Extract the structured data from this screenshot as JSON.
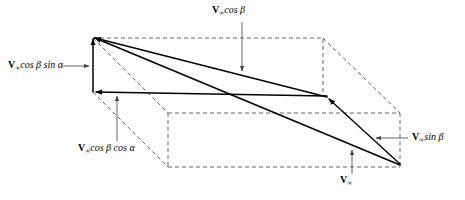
{
  "figure": {
    "type": "vector-decomposition-diagram",
    "colors": {
      "vector": "#000000",
      "box_dashed": "#555555",
      "leader": "#555555",
      "background": "#ffffff"
    }
  },
  "labels": {
    "v_cos_beta": {
      "symbol": "V",
      "subscript": "∞",
      "expr": "cos β",
      "full": "V∞ cos β"
    },
    "v_cos_beta_sin_alpha": {
      "symbol": "V",
      "subscript": "∞",
      "expr": "cos β sin α",
      "full": "V∞ cos β sin α"
    },
    "v_cos_beta_cos_alpha": {
      "symbol": "V",
      "subscript": "∞",
      "expr": "cos β cos α",
      "full": "V∞ cos β cos α"
    },
    "v_sin_beta": {
      "symbol": "V",
      "subscript": "∞",
      "expr": "sin β",
      "full": "V∞ sin β"
    },
    "v_infinity": {
      "symbol": "V",
      "subscript": "∞",
      "expr": "",
      "full": "V∞"
    }
  },
  "geometry": {
    "apex": [
      93,
      36
    ],
    "front_mid_left": [
      93,
      92
    ],
    "front_mid_right": [
      327,
      97
    ],
    "bottom_right": [
      400,
      165
    ],
    "back_top_right": [
      323,
      39
    ],
    "lower_front_left": [
      168,
      167
    ]
  }
}
